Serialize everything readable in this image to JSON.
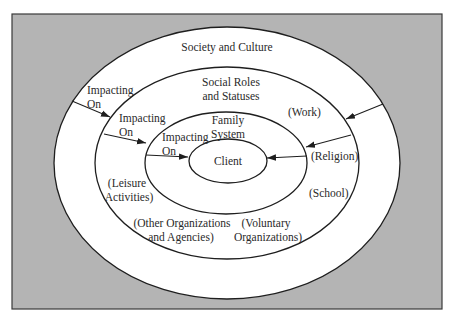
{
  "colors": {
    "background": "#ffffff",
    "frame_fill": "#b4b4b4",
    "frame_stroke": "#3a3a3a",
    "ellipse_fill": "#ffffff",
    "line": "#1e1e1e",
    "text": "#2a2a2a"
  },
  "diagram": {
    "layers": [
      {
        "id": "society",
        "title": "Society and Culture"
      },
      {
        "id": "social-roles",
        "title_line1": "Social Roles",
        "title_line2": "and Statuses"
      },
      {
        "id": "family",
        "title_line1": "Family",
        "title_line2": "System"
      },
      {
        "id": "client",
        "title": "Client"
      }
    ],
    "impact_labels": [
      {
        "line1": "Impacting",
        "line2": "On"
      },
      {
        "line1": "Impacting",
        "line2": "On"
      },
      {
        "line1": "Impacting",
        "line2": "On"
      }
    ],
    "examples": {
      "work": "(Work)",
      "religion": "(Religion)",
      "school": "(School)",
      "leisure_line1": "(Leisure",
      "leisure_line2": "Activities)",
      "other_orgs_line1": "(Other Organizations",
      "other_orgs_line2": "and Agencies)",
      "voluntary_line1": "(Voluntary",
      "voluntary_line2": "Organizations)"
    }
  }
}
